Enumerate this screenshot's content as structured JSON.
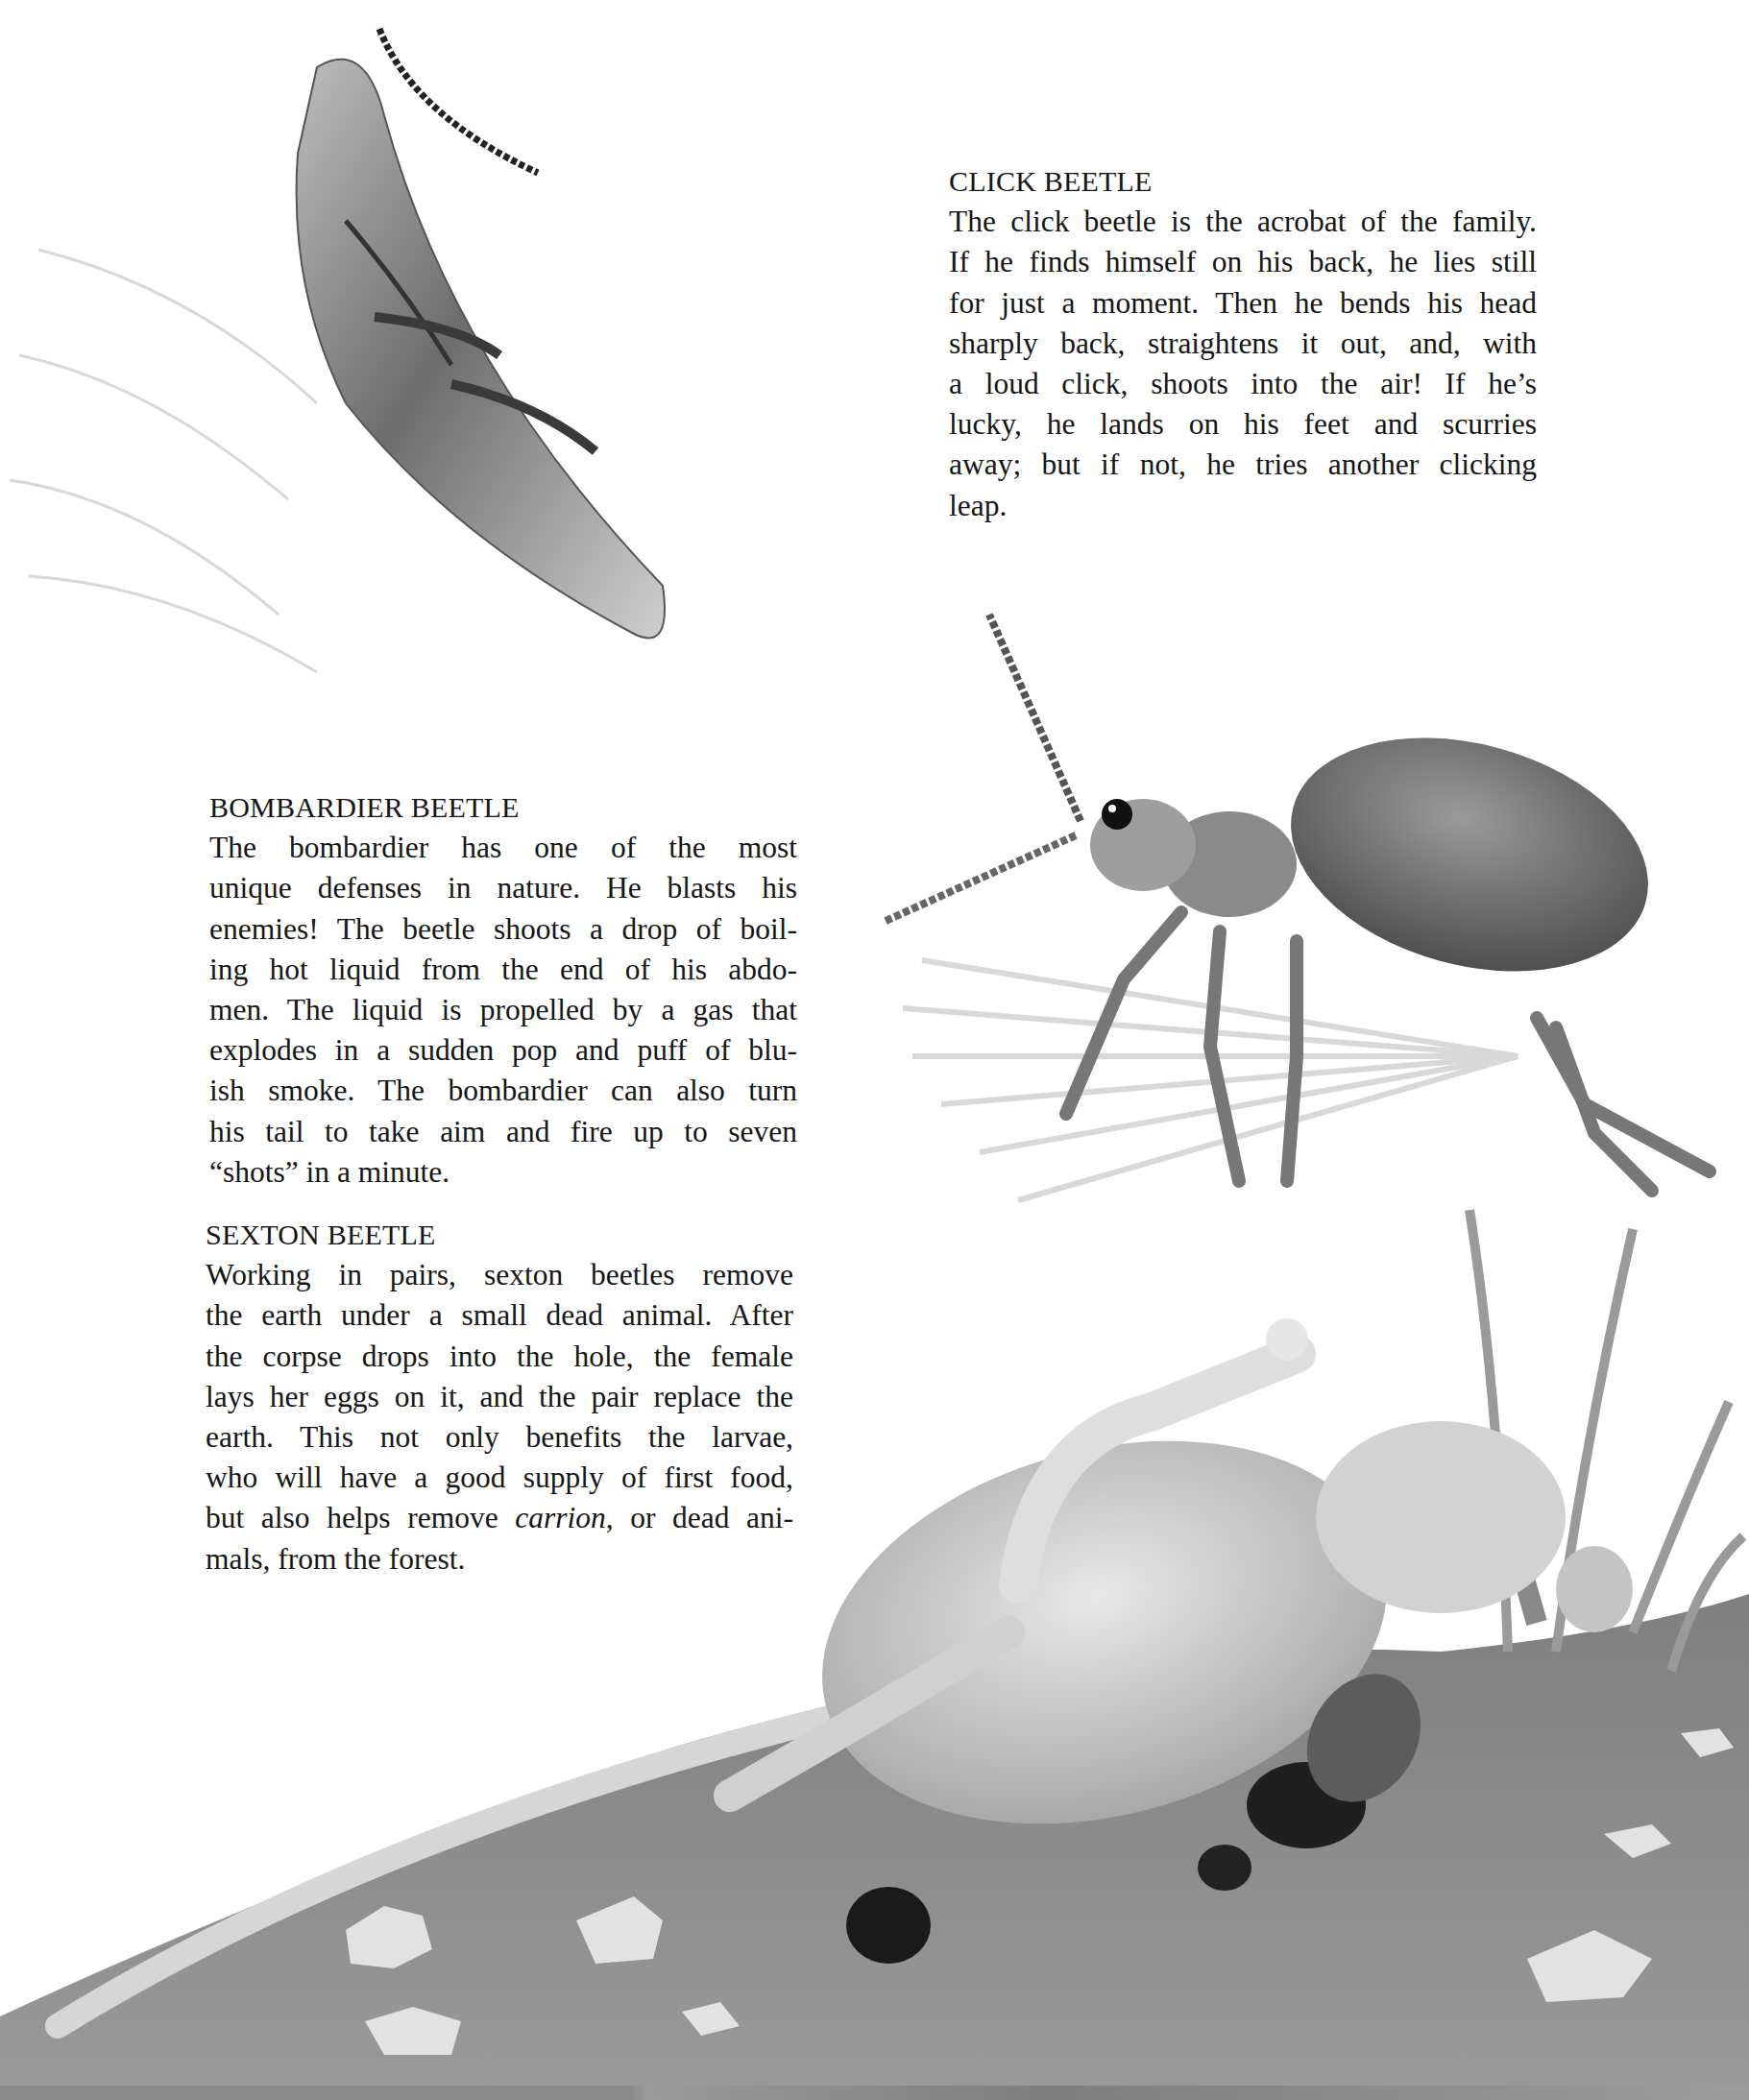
{
  "page": {
    "type": "illustrated book page",
    "palette": {
      "paper": "#ffffff",
      "ink": "#161616",
      "soil": "#8f8f8f",
      "beetle_dark": "#2b2b2b",
      "beetle_mid": "#6a6a6a"
    }
  },
  "sections": [
    {
      "id": "click-beetle",
      "heading": "CLICK BEETLE",
      "lines": [
        "The click beetle is the acrobat of the family.",
        "If he finds himself on his back, he lies still",
        "for just a moment. Then he bends his head",
        "sharply back, straightens it out, and, with",
        "a loud click, shoots into the air! If he’s",
        "lucky, he lands on his feet and scurries",
        "away; but if not, he tries another clicking",
        "leap."
      ]
    },
    {
      "id": "bombardier-beetle",
      "heading": "BOMBARDIER BEETLE",
      "lines": [
        "The bombardier has one of the most",
        "unique defenses in nature. He blasts his",
        "enemies! The beetle shoots a drop of boil-",
        "ing hot liquid from the end of his abdo-",
        "men. The liquid is propelled by a gas that",
        "explodes in a sudden pop and puff of blu-",
        "ish smoke. The bombardier can also turn",
        "his tail to take aim and fire up to seven",
        "“shots” in a minute."
      ]
    },
    {
      "id": "sexton-beetle",
      "heading": "SEXTON BEETLE",
      "lines": [
        "Working in pairs, sexton beetles remove",
        "the earth under a small dead animal. After",
        "the corpse drops into the hole, the female",
        "lays her eggs on it, and the pair replace the",
        "earth. This not only benefits the larvae,",
        "who will have a good supply of first food,",
        "mals, from the forest."
      ],
      "italic_line": {
        "before": "but also helps remove ",
        "italic": "carrion",
        "after": ", or dead ani-"
      }
    }
  ],
  "illustrations": [
    {
      "name": "click-beetle-illustration",
      "subject": "click beetle leaping upside down with motion lines"
    },
    {
      "name": "bombardier-beetle-illustration",
      "subject": "bombardier beetle spraying from abdomen"
    },
    {
      "name": "sexton-beetle-illustration",
      "subject": "dead mouse on soil with sexton beetles burrowing beneath"
    }
  ]
}
